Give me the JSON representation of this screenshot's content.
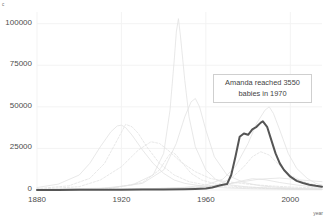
{
  "corner_label": "c",
  "axis_title_x": "year",
  "annotation": {
    "line1": "Amanda reached 3550",
    "line2": "babies in 1970"
  },
  "colors": {
    "highlight_line": "#555555",
    "background_line": "#e2e2e2",
    "grid": "#f2f2f2",
    "tick_text": "#4d4d4d",
    "annot_border": "#cfcfcf",
    "panel_bg": "#ffffff"
  },
  "chart_data": {
    "type": "line",
    "title": "",
    "xlabel": "year",
    "ylabel": "",
    "xlim": [
      1880,
      2015
    ],
    "ylim": [
      0,
      107000
    ],
    "grid": true,
    "legend": "none",
    "xticks": [
      1880,
      1920,
      1960,
      2000
    ],
    "yticks": [
      0,
      25000,
      50000,
      75000,
      100000
    ],
    "annotations": [
      {
        "text": "Amanda reached 3550 babies in 1970",
        "x": 1981,
        "y": 57000
      }
    ],
    "series": [
      {
        "name": "Amanda",
        "highlight": true,
        "color": "#555555",
        "x": [
          1880,
          1890,
          1900,
          1910,
          1920,
          1930,
          1940,
          1950,
          1955,
          1960,
          1963,
          1966,
          1968,
          1970,
          1972,
          1974,
          1976,
          1978,
          1980,
          1982,
          1984,
          1986,
          1987,
          1989,
          1991,
          1993,
          1995,
          1997,
          2000,
          2003,
          2006,
          2009,
          2012,
          2015
        ],
        "values": [
          60,
          70,
          90,
          120,
          200,
          260,
          330,
          430,
          600,
          900,
          1500,
          2600,
          3100,
          3550,
          9000,
          20000,
          32000,
          34000,
          33200,
          36500,
          38000,
          40500,
          41300,
          38000,
          30000,
          22000,
          16000,
          12000,
          8000,
          5500,
          4200,
          3200,
          2500,
          2000
        ]
      },
      {
        "name": "background-1920-hump",
        "highlight": false,
        "color": "#e2e2e2",
        "x": [
          1880,
          1890,
          1900,
          1905,
          1910,
          1915,
          1918,
          1920,
          1922,
          1925,
          1930,
          1935,
          1940,
          1945,
          1950,
          1960,
          1970,
          1980,
          1990,
          2000,
          2015
        ],
        "values": [
          1500,
          3500,
          9000,
          16000,
          26000,
          35000,
          38500,
          39000,
          37500,
          33000,
          24000,
          16000,
          10000,
          6000,
          4000,
          2000,
          1200,
          800,
          600,
          400,
          300
        ]
      },
      {
        "name": "background-1923-hump",
        "highlight": false,
        "color": "#e2e2e2",
        "x": [
          1880,
          1895,
          1905,
          1912,
          1918,
          1922,
          1925,
          1928,
          1932,
          1938,
          1945,
          1952,
          1960,
          1970,
          1980,
          1990,
          2000,
          2015
        ],
        "values": [
          800,
          2500,
          7000,
          16000,
          30000,
          39500,
          38000,
          34000,
          26000,
          16000,
          9000,
          5000,
          3000,
          1800,
          1200,
          900,
          600,
          400
        ],
        "dashed": true
      },
      {
        "name": "background-1935-broad",
        "highlight": false,
        "color": "#e2e2e2",
        "x": [
          1880,
          1900,
          1910,
          1920,
          1928,
          1934,
          1938,
          1942,
          1948,
          1955,
          1962,
          1970,
          1980,
          1990,
          2000,
          2015
        ],
        "values": [
          400,
          2000,
          6000,
          14000,
          24000,
          29000,
          28000,
          24000,
          17000,
          11000,
          7000,
          5000,
          3500,
          2500,
          1800,
          1200
        ],
        "dashed": true
      },
      {
        "name": "background-1947-spike",
        "highlight": false,
        "color": "#e2e2e2",
        "x": [
          1880,
          1910,
          1925,
          1935,
          1940,
          1943,
          1945,
          1946,
          1947,
          1948,
          1950,
          1952,
          1955,
          1960,
          1965,
          1972,
          1980,
          1990,
          2000,
          2015
        ],
        "values": [
          200,
          900,
          3000,
          9000,
          22000,
          48000,
          78000,
          95000,
          103000,
          92000,
          66000,
          44000,
          26000,
          12000,
          6000,
          3000,
          1800,
          1100,
          700,
          500
        ]
      },
      {
        "name": "background-1955-peak",
        "highlight": false,
        "color": "#e2e2e2",
        "x": [
          1880,
          1915,
          1930,
          1940,
          1946,
          1950,
          1953,
          1955,
          1957,
          1960,
          1964,
          1970,
          1978,
          1986,
          1995,
          2005,
          2015
        ],
        "values": [
          300,
          1200,
          4000,
          12000,
          28000,
          44000,
          53000,
          55000,
          50000,
          36000,
          20000,
          9000,
          4500,
          2500,
          1500,
          900,
          600
        ]
      },
      {
        "name": "background-1990-peak",
        "highlight": false,
        "color": "#e2e2e2",
        "x": [
          1880,
          1930,
          1950,
          1960,
          1968,
          1974,
          1980,
          1984,
          1988,
          1990,
          1992,
          1995,
          1999,
          2003,
          2008,
          2012,
          2015
        ],
        "values": [
          150,
          600,
          1600,
          3000,
          6500,
          14000,
          28000,
          40000,
          48000,
          50000,
          46000,
          36000,
          22000,
          13000,
          7000,
          4000,
          3000
        ]
      },
      {
        "name": "background-1985-mid",
        "highlight": false,
        "color": "#e2e2e2",
        "x": [
          1880,
          1930,
          1955,
          1965,
          1972,
          1978,
          1982,
          1986,
          1990,
          1994,
          2000,
          2006,
          2012,
          2015
        ],
        "values": [
          120,
          500,
          1400,
          3000,
          7000,
          14000,
          20000,
          23000,
          21000,
          16000,
          9000,
          5000,
          3000,
          2500
        ],
        "dashed": true
      },
      {
        "name": "background-flat-late",
        "highlight": false,
        "color": "#e2e2e2",
        "x": [
          1880,
          1920,
          1950,
          1965,
          1975,
          1985,
          1995,
          2005,
          2015
        ],
        "values": [
          100,
          400,
          1200,
          2600,
          4500,
          6500,
          7200,
          6000,
          5000
        ]
      },
      {
        "name": "background-1944-rise",
        "highlight": false,
        "color": "#e2e2e2",
        "x": [
          1880,
          1915,
          1930,
          1938,
          1942,
          1944,
          1946,
          1949,
          1953,
          1958,
          1965,
          1975,
          1990,
          2005,
          2015
        ],
        "values": [
          200,
          1000,
          4500,
          12000,
          20000,
          23000,
          21000,
          16000,
          10000,
          6000,
          3500,
          2000,
          1200,
          700,
          500
        ],
        "dashed": true
      },
      {
        "name": "background-1970s-low",
        "highlight": false,
        "color": "#e2e2e2",
        "x": [
          1880,
          1930,
          1955,
          1968,
          1976,
          1982,
          1988,
          1995,
          2003,
          2010,
          2015
        ],
        "values": [
          80,
          350,
          1100,
          2800,
          5200,
          6800,
          6200,
          4500,
          3000,
          2000,
          1600
        ]
      }
    ]
  }
}
